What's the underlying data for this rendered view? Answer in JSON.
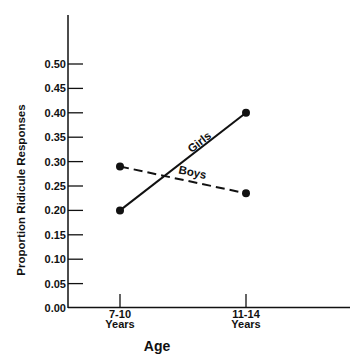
{
  "chart_data": {
    "type": "line",
    "title": "",
    "xlabel": "Age",
    "ylabel": "Proportion Ridicule Responses",
    "categories": [
      "7-10 Years",
      "11-14 Years"
    ],
    "category_lines": [
      [
        "7-10",
        "Years"
      ],
      [
        "11-14",
        "Years"
      ]
    ],
    "series": [
      {
        "name": "Girls",
        "values": [
          0.2,
          0.4
        ],
        "line_style": "solid"
      },
      {
        "name": "Boys",
        "values": [
          0.29,
          0.235
        ],
        "line_style": "dashed"
      }
    ],
    "yticks": [
      "0.00",
      "0.05",
      "0.10",
      "0.15",
      "0.20",
      "0.25",
      "0.30",
      "0.35",
      "0.40",
      "0.45",
      "0.50"
    ],
    "ylim": [
      0,
      0.5
    ],
    "grid": false,
    "legend": "inline labels on lines",
    "colors": {
      "line": "#111111",
      "background": "#ffffff"
    }
  }
}
